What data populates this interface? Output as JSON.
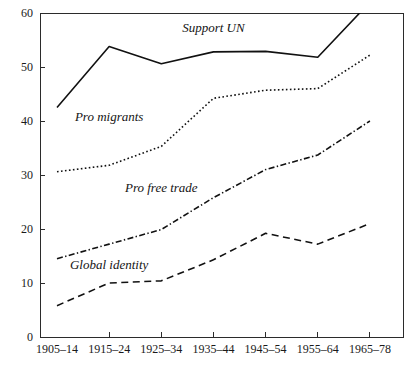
{
  "chart_data": {
    "type": "line",
    "title": "",
    "subtitle": "",
    "xlabel": "",
    "ylabel": "",
    "categories": [
      "1905–14",
      "1915–24",
      "1925–34",
      "1935–44",
      "1945–54",
      "1955–64",
      "1965–78"
    ],
    "xlim": [
      0,
      6
    ],
    "ylim": [
      0,
      60
    ],
    "yticks": [
      0,
      10,
      20,
      30,
      40,
      50,
      60
    ],
    "ytick_labels": [
      "0",
      "10",
      "20",
      "30",
      "40",
      "50",
      "60"
    ],
    "grid": false,
    "legend": "inline-labels",
    "legend_position": "inline",
    "series": [
      {
        "name": "Support UN",
        "label": "Support UN",
        "style": "solid",
        "values": [
          42.5,
          53.8,
          50.6,
          52.8,
          52.9,
          51.8,
          62.0
        ],
        "label_x_category_index": 3,
        "label_value": 56.5
      },
      {
        "name": "Pro migrants",
        "label": "Pro migrants",
        "style": "dotted",
        "values": [
          30.6,
          31.8,
          35.3,
          44.2,
          45.7,
          46.0,
          52.2
        ],
        "label_x_category_index": 1,
        "label_value": 40.0
      },
      {
        "name": "Pro free trade",
        "label": "Pro free trade",
        "style": "dashdot",
        "values": [
          14.5,
          17.2,
          19.9,
          25.8,
          31.0,
          33.7,
          40.0
        ],
        "label_x_category_index": 2,
        "label_value": 26.8
      },
      {
        "name": "Global identity",
        "label": "Global identity",
        "style": "dashed",
        "values": [
          5.8,
          10.0,
          10.4,
          14.3,
          19.2,
          17.2,
          21.0
        ],
        "label_x_category_index": 1,
        "label_value": 12.6
      }
    ]
  },
  "plot": {
    "left": 40,
    "right": 403,
    "top": 13,
    "bottom": 337
  }
}
